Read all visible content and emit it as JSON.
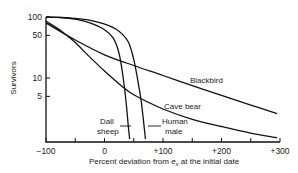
{
  "chart_data": {
    "type": "line",
    "title": "",
    "xlabel": "Percent deviation from e_x at the initial date",
    "xlabel_parts": {
      "before": "Percent deviation from ",
      "var": "e",
      "sub": "x",
      "after": " at the initial date"
    },
    "ylabel": "Survivors",
    "yscale": "log",
    "xlim": [
      -100,
      300
    ],
    "ylim": [
      1,
      100
    ],
    "x_ticks": [
      -100,
      -50,
      0,
      50,
      100,
      150,
      200,
      250,
      300
    ],
    "x_tick_labels": [
      {
        "value": -100,
        "label": "−100"
      },
      {
        "value": 0,
        "label": "0"
      },
      {
        "value": 100,
        "label": "+100"
      },
      {
        "value": 200,
        "label": "+200"
      },
      {
        "value": 300,
        "label": "+300"
      }
    ],
    "y_tick_labels": [
      {
        "value": 100,
        "label": "100"
      },
      {
        "value": 50,
        "label": "50"
      },
      {
        "value": 10,
        "label": "10"
      },
      {
        "value": 5,
        "label": "5"
      }
    ],
    "grid": false,
    "legend": "inline labels",
    "series": [
      {
        "name": "Blackbird",
        "points": [
          [
            -100,
            80
          ],
          [
            -50,
            42
          ],
          [
            0,
            24
          ],
          [
            50,
            16
          ],
          [
            100,
            11
          ],
          [
            150,
            7.5
          ],
          [
            200,
            5.2
          ],
          [
            250,
            3.6
          ],
          [
            295,
            2.6
          ]
        ]
      },
      {
        "name": "Cave bear",
        "points": [
          [
            -100,
            85
          ],
          [
            -75,
            60
          ],
          [
            -50,
            38
          ],
          [
            -25,
            22
          ],
          [
            0,
            13
          ],
          [
            25,
            8
          ],
          [
            50,
            5.3
          ],
          [
            100,
            3.1
          ],
          [
            150,
            2.1
          ],
          [
            200,
            1.6
          ],
          [
            250,
            1.25
          ],
          [
            295,
            1.05
          ]
        ]
      },
      {
        "name": "Dall sheep",
        "points": [
          [
            -100,
            100
          ],
          [
            -75,
            98
          ],
          [
            -50,
            92
          ],
          [
            -25,
            80
          ],
          [
            0,
            62
          ],
          [
            15,
            45
          ],
          [
            25,
            25
          ],
          [
            32,
            10
          ],
          [
            37,
            4
          ],
          [
            41,
            1.5
          ],
          [
            43,
            1
          ]
        ]
      },
      {
        "name": "Human male",
        "points": [
          [
            -100,
            100
          ],
          [
            -50,
            95
          ],
          [
            -10,
            82
          ],
          [
            20,
            63
          ],
          [
            40,
            40
          ],
          [
            50,
            20
          ],
          [
            58,
            8
          ],
          [
            63,
            4
          ],
          [
            68,
            1.5
          ],
          [
            70,
            1
          ]
        ]
      }
    ],
    "annotations": [
      {
        "text": "Blackbird",
        "x": 190,
        "y": 12.5
      },
      {
        "text": "Cave bear",
        "x": 156,
        "y": 4.2
      },
      {
        "text": "Dall sheep",
        "x": 3,
        "y": 1.7,
        "leader_to": [
          34,
          2.0
        ]
      },
      {
        "text": "Human male",
        "x": 112,
        "y": 1.7,
        "leader_to": [
          66,
          2.0
        ]
      }
    ]
  },
  "labels": {
    "ylabel": "Survivors",
    "blackbird": "Blackbird",
    "cave_bear": "Cave bear",
    "dall_1": "Dall",
    "dall_2": "sheep",
    "human_1": "Human",
    "human_2": "male"
  }
}
